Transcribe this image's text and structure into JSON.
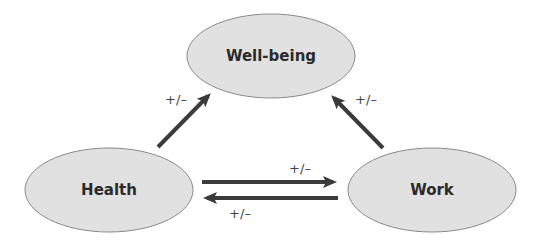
{
  "diagram": {
    "type": "causal-relationship",
    "colors": {
      "node_fill": "#e1e1e1",
      "node_stroke": "#8a8a8a",
      "text": "#2b2b2b",
      "arrow": "#3b3b3b"
    },
    "nodes": [
      {
        "id": "wellbeing",
        "label": "Well-being"
      },
      {
        "id": "health",
        "label": "Health"
      },
      {
        "id": "work",
        "label": "Work"
      }
    ],
    "edges": [
      {
        "from": "health",
        "to": "wellbeing",
        "label": "+/–"
      },
      {
        "from": "work",
        "to": "wellbeing",
        "label": "+/–"
      },
      {
        "from": "health",
        "to": "work",
        "label": "+/–"
      },
      {
        "from": "work",
        "to": "health",
        "label": "+/–"
      }
    ]
  }
}
